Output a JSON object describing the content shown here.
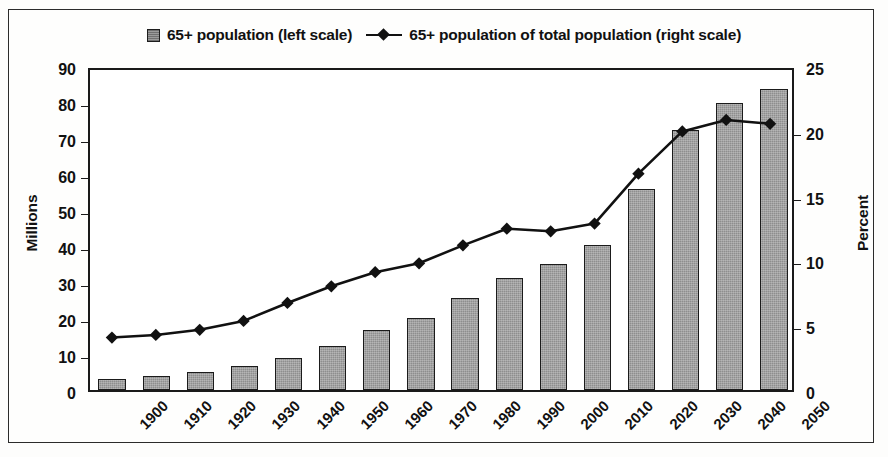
{
  "legend": {
    "bar_swatch_name": "bar-swatch",
    "bar_label": "65+ population (left scale)",
    "line_marker_name": "line-marker",
    "line_label": "65+ population of total population (right scale)"
  },
  "axes": {
    "left_title": "Millions",
    "right_title": "Percent",
    "left_ticks": [
      "0",
      "10",
      "20",
      "30",
      "40",
      "50",
      "60",
      "70",
      "80",
      "90"
    ],
    "right_ticks": [
      "0",
      "5",
      "10",
      "15",
      "20",
      "25"
    ]
  },
  "chart_data": {
    "type": "bar",
    "title": "",
    "subtitle": "",
    "xlabel": "",
    "ylabel": "Millions",
    "y2label": "Percent",
    "categories": [
      "1900",
      "1910",
      "1920",
      "1930",
      "1940",
      "1950",
      "1960",
      "1970",
      "1980",
      "1990",
      "2000",
      "2010",
      "2020",
      "2030",
      "2040",
      "2050"
    ],
    "ylim": [
      0,
      90
    ],
    "y2lim": [
      0,
      25
    ],
    "ytick_step": 10,
    "y2tick_step": 5,
    "grid": false,
    "legend_position": "top-center",
    "series": [
      {
        "name": "65+ population (left scale)",
        "type": "bar",
        "axis": "left",
        "unit": "millions",
        "values": [
          3.1,
          4.0,
          4.9,
          6.6,
          9.0,
          12.3,
          16.6,
          20.0,
          25.5,
          31.2,
          35.0,
          40.2,
          55.9,
          72.1,
          79.7,
          83.7
        ]
      },
      {
        "name": "65+ population of total population (right scale)",
        "type": "line",
        "axis": "right",
        "unit": "percent",
        "marker": "diamond",
        "values": [
          4.1,
          4.3,
          4.7,
          5.4,
          6.8,
          8.1,
          9.2,
          9.9,
          11.3,
          12.6,
          12.4,
          13.0,
          16.9,
          20.2,
          21.1,
          20.8
        ]
      }
    ]
  },
  "colors": {
    "bar_fill": "#8e8e8e",
    "bar_edge": "#1b1b1b",
    "line": "#111111",
    "axis": "#1a1a1a",
    "frame": "#2b2b2b",
    "background": "#fefefd"
  }
}
